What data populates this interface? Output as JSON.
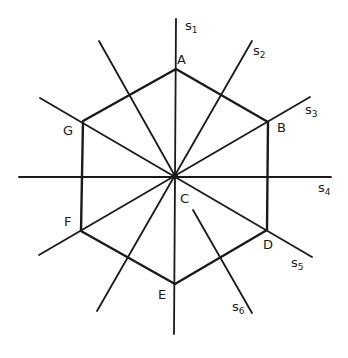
{
  "diagram": {
    "title": "",
    "center": {
      "name": "C",
      "x": 175,
      "y": 176
    },
    "vertices": [
      {
        "name": "A",
        "x": 176,
        "y": 69
      },
      {
        "name": "B",
        "x": 268,
        "y": 122
      },
      {
        "name": "D",
        "x": 267,
        "y": 230
      },
      {
        "name": "E",
        "x": 175,
        "y": 284
      },
      {
        "name": "F",
        "x": 81,
        "y": 231
      },
      {
        "name": "G",
        "x": 83,
        "y": 121
      }
    ],
    "symmetry_axes": [
      {
        "name": "s",
        "sub": "1"
      },
      {
        "name": "s",
        "sub": "2"
      },
      {
        "name": "s",
        "sub": "3"
      },
      {
        "name": "s",
        "sub": "4"
      },
      {
        "name": "s",
        "sub": "5"
      },
      {
        "name": "s",
        "sub": "6"
      }
    ],
    "labels": {
      "A": "A",
      "B": "B",
      "C": "C",
      "D": "D",
      "E": "E",
      "F": "F",
      "G": "G"
    },
    "colors": {
      "line": "#1a1a1a",
      "background": "#ffffff"
    }
  }
}
